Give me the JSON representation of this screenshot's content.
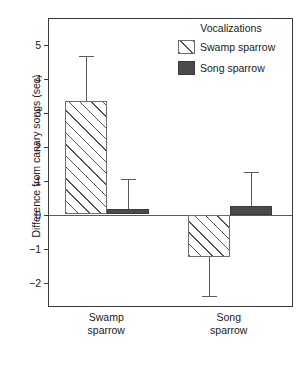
{
  "chart_data": {
    "type": "bar",
    "title": "",
    "xlabel": "",
    "ylabel": "Difference from canary songs (sec)",
    "categories": [
      "Swamp sparrow",
      "Song sparrow"
    ],
    "category_lines": [
      [
        "Swamp",
        "sparrow"
      ],
      [
        "Song",
        "sparrow"
      ]
    ],
    "legend_title": "Vocalizations",
    "legend_position": "upper right",
    "grid": false,
    "ylim": [
      -2.75,
      5.75
    ],
    "yticks": [
      5,
      4,
      3,
      2,
      1,
      0,
      -1,
      -2
    ],
    "ytick_labels": [
      "5",
      "4",
      "3",
      "2",
      "1",
      "0",
      "−1",
      "−2"
    ],
    "zero_line": 0,
    "series": [
      {
        "name": "Swamp sparrow",
        "fill": "hatched",
        "color": "#555555",
        "values": [
          3.33,
          -1.25
        ],
        "error_upper": [
          4.65,
          -1.25
        ],
        "error_lower": [
          3.33,
          -2.4
        ]
      },
      {
        "name": "Song sparrow",
        "fill": "solid",
        "color": "#4a4a4a",
        "values": [
          0.17,
          0.25
        ],
        "error_upper": [
          1.05,
          1.25
        ],
        "error_lower": [
          0.17,
          0.25
        ]
      }
    ]
  }
}
